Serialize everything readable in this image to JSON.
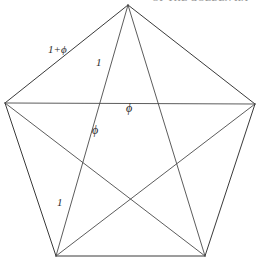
{
  "figure": {
    "background_color": "#ffffff",
    "line_color": "#3a3a3a",
    "width": 259,
    "height": 262,
    "header_fragment": "OF THE GOLDEN RA",
    "shape": {
      "type": "pentagon-with-pentagram",
      "vertices": [
        {
          "name": "top",
          "x": 128,
          "y": 5
        },
        {
          "name": "right",
          "x": 255,
          "y": 104
        },
        {
          "name": "bottom-right",
          "x": 205,
          "y": 256
        },
        {
          "name": "bottom-left",
          "x": 56,
          "y": 256
        },
        {
          "name": "left",
          "x": 5,
          "y": 103
        }
      ],
      "edges": [
        {
          "from": "top",
          "to": "right"
        },
        {
          "from": "right",
          "to": "bottom-right"
        },
        {
          "from": "bottom-right",
          "to": "bottom-left"
        },
        {
          "from": "bottom-left",
          "to": "left"
        },
        {
          "from": "left",
          "to": "top"
        }
      ],
      "diagonals": [
        {
          "from": "top",
          "to": "bottom-left"
        },
        {
          "from": "top",
          "to": "bottom-right"
        },
        {
          "from": "right",
          "to": "bottom-left"
        },
        {
          "from": "right",
          "to": "left"
        },
        {
          "from": "bottom-right",
          "to": "left"
        }
      ]
    },
    "labels": [
      {
        "id": "edge-label",
        "text": "1+ϕ",
        "x": 48,
        "y": 44,
        "role": "pentagon-edge-length"
      },
      {
        "id": "upper-segment-label",
        "text": "1",
        "x": 96,
        "y": 57,
        "role": "diagonal-segment-length"
      },
      {
        "id": "chord-phi-label",
        "text": "ϕ",
        "x": 126,
        "y": 102,
        "role": "diagonal-segment-length"
      },
      {
        "id": "mid-phi-label",
        "text": "ϕ",
        "x": 92,
        "y": 124,
        "role": "diagonal-segment-length"
      },
      {
        "id": "lower-segment-label",
        "text": "1",
        "x": 57,
        "y": 197,
        "role": "diagonal-segment-length"
      }
    ]
  }
}
